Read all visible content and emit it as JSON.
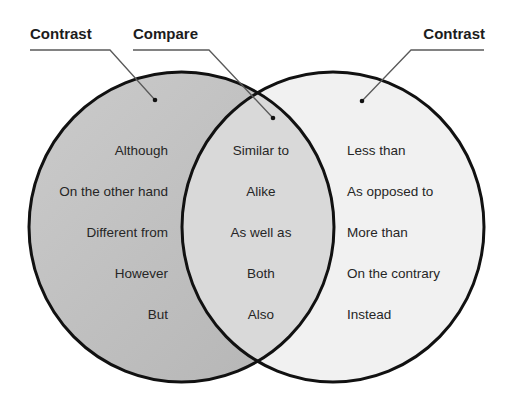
{
  "diagram": {
    "type": "venn",
    "colors": {
      "left_fill": "#c4c4c4",
      "left_fill_dark": "#b6b6b6",
      "overlap_fill": "#dadada",
      "right_fill": "#f1f1f1",
      "stroke": "#111111",
      "leader": "#555555",
      "text": "#262626"
    },
    "labels": {
      "left": "Contrast",
      "middle": "Compare",
      "right": "Contrast"
    },
    "sets": {
      "left": {
        "label": "Contrast",
        "items": [
          "Although",
          "On the other hand",
          "Different from",
          "However",
          "But"
        ]
      },
      "overlap": {
        "label": "Compare",
        "items": [
          "Similar to",
          "Alike",
          "As well as",
          "Both",
          "Also"
        ]
      },
      "right": {
        "label": "Contrast",
        "items": [
          "Less than",
          "As opposed to",
          "More than",
          "On the contrary",
          "Instead"
        ]
      }
    }
  }
}
